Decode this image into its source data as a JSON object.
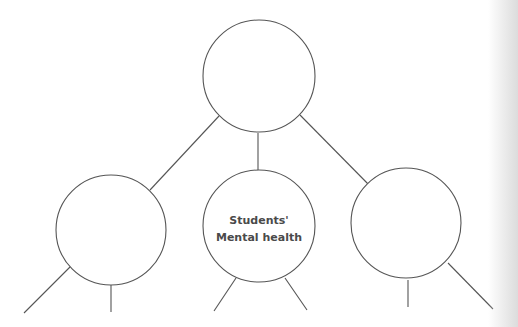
{
  "diagram": {
    "type": "mind-map",
    "colors": {
      "stroke": "#555555",
      "background": "#ffffff",
      "text": "#4a4a4a"
    },
    "nodes": [
      {
        "id": "root",
        "label": ""
      },
      {
        "id": "left",
        "label": ""
      },
      {
        "id": "center",
        "label_line1": "Students'",
        "label_line2": "Mental health"
      },
      {
        "id": "right",
        "label": ""
      }
    ]
  }
}
